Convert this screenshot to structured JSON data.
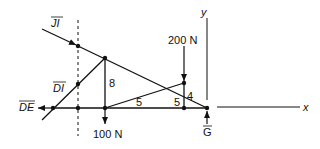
{
  "diagram": {
    "forces": {
      "JI": "JI",
      "DI": "DI",
      "DE": "DE",
      "G": "G",
      "load_top": "200 N",
      "load_bottom": "100 N"
    },
    "dimensions": {
      "member_8": "8",
      "member_4": "4",
      "span_left": "5",
      "span_right": "5"
    },
    "axes": {
      "x": "x",
      "y": "y"
    },
    "colors": {
      "line": "#111111",
      "background": "#ffffff"
    }
  }
}
